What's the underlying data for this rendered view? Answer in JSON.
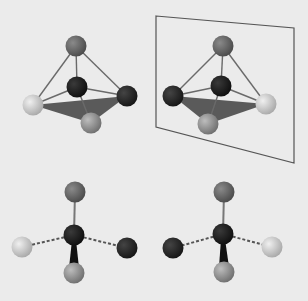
{
  "diagram": {
    "title": "",
    "colors": {
      "background": "#ebebeb",
      "bond": "#6a6a6a",
      "face": "#5a5a5a",
      "mirror": "#555555",
      "atom_top": "#5e5e5e",
      "atom_center": "#1e1e1e",
      "atom_dark": "#262626",
      "atom_light": "#c8c8c8",
      "atom_mid": "#8e8e8e"
    },
    "panels": [
      {
        "name": "original-3d",
        "atoms": [
          {
            "role": "top",
            "x": 76,
            "y": 46,
            "shade": "top"
          },
          {
            "role": "center",
            "x": 77,
            "y": 87,
            "shade": "center"
          },
          {
            "role": "right",
            "x": 127,
            "y": 96,
            "shade": "dark"
          },
          {
            "role": "left",
            "x": 33,
            "y": 105,
            "shade": "light"
          },
          {
            "role": "front",
            "x": 91,
            "y": 123,
            "shade": "mid"
          }
        ]
      },
      {
        "name": "mirror-image-3d",
        "atoms": [
          {
            "role": "top",
            "x": 223,
            "y": 46,
            "shade": "top"
          },
          {
            "role": "center",
            "x": 221,
            "y": 86,
            "shade": "center"
          },
          {
            "role": "left",
            "x": 173,
            "y": 96,
            "shade": "dark"
          },
          {
            "role": "right",
            "x": 266,
            "y": 104,
            "shade": "light"
          },
          {
            "role": "front",
            "x": 208,
            "y": 124,
            "shade": "mid"
          }
        ]
      },
      {
        "name": "original-projection",
        "atoms": [
          {
            "role": "top",
            "x": 75,
            "y": 192,
            "shade": "top"
          },
          {
            "role": "center",
            "x": 74,
            "y": 235,
            "shade": "center"
          },
          {
            "role": "left",
            "x": 22,
            "y": 247,
            "shade": "light"
          },
          {
            "role": "right",
            "x": 127,
            "y": 248,
            "shade": "dark"
          },
          {
            "role": "bottom",
            "x": 74,
            "y": 273,
            "shade": "mid"
          }
        ]
      },
      {
        "name": "mirror-projection",
        "atoms": [
          {
            "role": "top",
            "x": 224,
            "y": 192,
            "shade": "top"
          },
          {
            "role": "center",
            "x": 223,
            "y": 234,
            "shade": "center"
          },
          {
            "role": "left",
            "x": 173,
            "y": 248,
            "shade": "dark"
          },
          {
            "role": "right",
            "x": 272,
            "y": 247,
            "shade": "light"
          },
          {
            "role": "bottom",
            "x": 224,
            "y": 272,
            "shade": "mid"
          }
        ]
      }
    ],
    "mirror_plane": {
      "points": "156,16 294,28 294,163 156,127"
    }
  }
}
